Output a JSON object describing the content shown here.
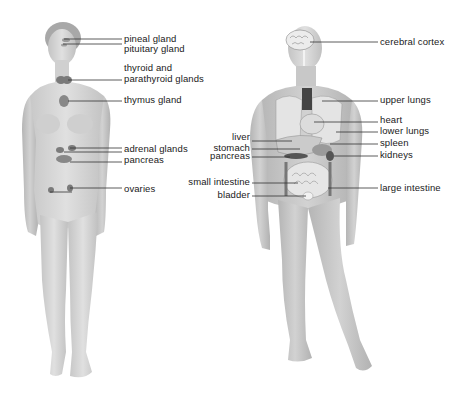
{
  "diagram": {
    "colors": {
      "background": "#ffffff",
      "skin": "#d6d6d6",
      "skin_shadow": "#b9b9b9",
      "organ_dark": "#6e6e6e",
      "organ_mid": "#9a9a9a",
      "organ_light": "#e9e9e9",
      "leader_line": "#333333",
      "text": "#1a1a1a"
    },
    "female_figure": {
      "title": "endocrine system",
      "labels": [
        {
          "id": "pineal",
          "text": "pineal gland"
        },
        {
          "id": "pituitary",
          "text": "pituitary gland"
        },
        {
          "id": "thyroid_1",
          "text": "thyroid and"
        },
        {
          "id": "thyroid_2",
          "text": "parathyroid glands"
        },
        {
          "id": "thymus",
          "text": "thymus gland"
        },
        {
          "id": "adrenal",
          "text": "adrenal glands"
        },
        {
          "id": "pancreas",
          "text": "pancreas"
        },
        {
          "id": "ovaries",
          "text": "ovaries"
        }
      ]
    },
    "male_figure": {
      "title": "internal organs",
      "labels_right": [
        {
          "id": "cortex",
          "text": "cerebral cortex"
        },
        {
          "id": "upper_lungs",
          "text": "upper lungs"
        },
        {
          "id": "heart",
          "text": "heart"
        },
        {
          "id": "lower_lungs",
          "text": "lower lungs"
        },
        {
          "id": "spleen",
          "text": "spleen"
        },
        {
          "id": "kidneys",
          "text": "kidneys"
        },
        {
          "id": "large_intestine",
          "text": "large intestine"
        }
      ],
      "labels_left": [
        {
          "id": "liver",
          "text": "liver"
        },
        {
          "id": "stomach",
          "text": "stomach"
        },
        {
          "id": "pancreas",
          "text": "pancreas"
        },
        {
          "id": "small_intestine",
          "text": "small intestine"
        },
        {
          "id": "bladder",
          "text": "bladder"
        }
      ]
    }
  }
}
